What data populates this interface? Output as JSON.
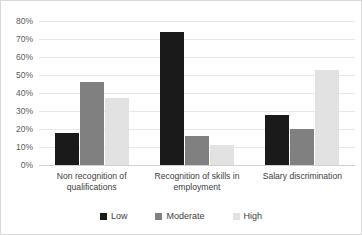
{
  "chart_data": {
    "type": "bar",
    "title": "",
    "subtitle": "",
    "xlabel": "",
    "ylabel": "",
    "ylim": [
      0,
      80
    ],
    "ytick_step": 10,
    "grid": true,
    "legend_position": "bottom",
    "categories": [
      "Non recognition of qualifications",
      "Recognition of skills in employment",
      "Salary discrimination"
    ],
    "ytick_labels": [
      "80%",
      "70%",
      "60%",
      "50%",
      "40%",
      "30%",
      "20%",
      "10%",
      "0%"
    ],
    "ytick_values": [
      80,
      70,
      60,
      50,
      40,
      30,
      20,
      10,
      0
    ],
    "series": [
      {
        "name": "Low",
        "color": "#1a1a1a",
        "values": [
          18,
          74,
          28
        ]
      },
      {
        "name": "Moderate",
        "color": "#808080",
        "values": [
          46,
          16,
          20
        ]
      },
      {
        "name": "High",
        "color": "#e2e2e2",
        "values": [
          37,
          11,
          53
        ]
      }
    ]
  },
  "legend": {
    "items": [
      {
        "label": "Low",
        "color": "#1a1a1a"
      },
      {
        "label": "Moderate",
        "color": "#808080"
      },
      {
        "label": "High",
        "color": "#e2e2e2"
      }
    ]
  }
}
